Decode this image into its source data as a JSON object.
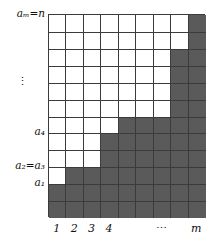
{
  "figure": {
    "kind": "young-diagram-staircase",
    "grid": {
      "columns": 9,
      "rows": 12,
      "origin_x": 48,
      "origin_y": 14,
      "cell_w": 17.44,
      "cell_h": 16.92,
      "fill_color": "#5a5a5a",
      "empty_color": "#ffffff",
      "line_color": "#3b3b3b",
      "column_heights": [
        2,
        3,
        3,
        5,
        6,
        6,
        6,
        10,
        12
      ]
    },
    "y_labels": [
      {
        "text": "aₘ=n",
        "row_top": 12
      },
      {
        "text": "⋮",
        "row_top": 8,
        "is_ellipsis": true
      },
      {
        "text": "a₄",
        "row_top": 5
      },
      {
        "text": "a₂=a₃",
        "row_top": 3
      },
      {
        "text": "a₁",
        "row_top": 2
      }
    ],
    "x_labels": [
      {
        "text": "1",
        "column": 1
      },
      {
        "text": "2",
        "column": 2
      },
      {
        "text": "3",
        "column": 3
      },
      {
        "text": "4",
        "column": 4
      },
      {
        "text": "⋯",
        "column": 7,
        "is_ellipsis": true
      },
      {
        "text": "m",
        "column": 9
      }
    ]
  },
  "chart_data": {
    "type": "bar",
    "title": "",
    "xlabel": "m",
    "ylabel": "n",
    "categories": [
      "1",
      "2",
      "3",
      "4",
      "5",
      "6",
      "7",
      "8",
      "9"
    ],
    "values": [
      2,
      3,
      3,
      5,
      6,
      6,
      6,
      10,
      12
    ],
    "xlim": [
      0,
      9
    ],
    "ylim": [
      0,
      12
    ],
    "grid": true,
    "legend": null,
    "x_tick_labels": [
      "1",
      "2",
      "3",
      "4",
      "",
      "",
      "⋯",
      "",
      "m"
    ],
    "y_tick_labels": [
      "a₁",
      "a₂=a₃",
      "a₄",
      "⋮",
      "aₘ=n"
    ],
    "annotations": [
      "a₁ = 2",
      "a₂ = a₃ = 3",
      "a₄ = 5",
      "aₘ = n = 12"
    ]
  }
}
